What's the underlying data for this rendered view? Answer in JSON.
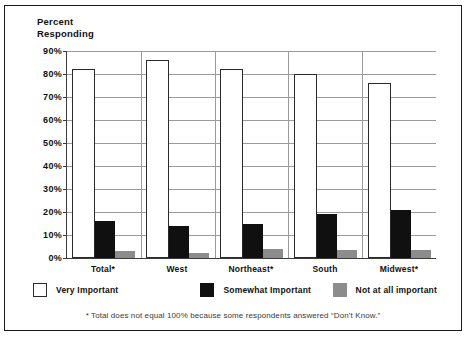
{
  "page_bleed_text": "· · · · · ·",
  "figure": {
    "y_axis_title_line1": "Percent",
    "y_axis_title_line2": "Responding",
    "footnote": "* Total does not equal 100% because some respondents answered “Don’t Know.”"
  },
  "legend": {
    "items": [
      {
        "label": "Very Important",
        "swatch": "white-square-icon",
        "color": "#ffffff"
      },
      {
        "label": "Somewhat Important",
        "swatch": "black-square-icon",
        "color": "#101010"
      },
      {
        "label": "Not at all important",
        "swatch": "gray-square-icon",
        "color": "#8c8c8c"
      }
    ]
  },
  "chart_data": {
    "type": "bar",
    "title": "",
    "subtitle": "",
    "xlabel": "",
    "ylabel": "Percent Responding",
    "ylim": [
      0,
      90
    ],
    "ytick_labels": [
      "0%",
      "10%",
      "20%",
      "30%",
      "40%",
      "50%",
      "60%",
      "70%",
      "80%",
      "90%"
    ],
    "ytick_values": [
      0,
      10,
      20,
      30,
      40,
      50,
      60,
      70,
      80,
      90
    ],
    "grid": true,
    "legend_position": "bottom",
    "categories": [
      "Total*",
      "West",
      "Northeast*",
      "South",
      "Midwest*"
    ],
    "series": [
      {
        "name": "Very Important",
        "color": "#ffffff",
        "values": [
          82,
          86,
          82,
          80,
          76
        ]
      },
      {
        "name": "Somewhat Important",
        "color": "#101010",
        "values": [
          16,
          14,
          15,
          19,
          21
        ]
      },
      {
        "name": "Not at all important",
        "color": "#8c8c8c",
        "values": [
          3,
          2,
          4,
          3.5,
          3.5
        ]
      }
    ],
    "annotations": [
      "* Total does not equal 100% because some respondents answered “Don’t Know.”"
    ]
  }
}
